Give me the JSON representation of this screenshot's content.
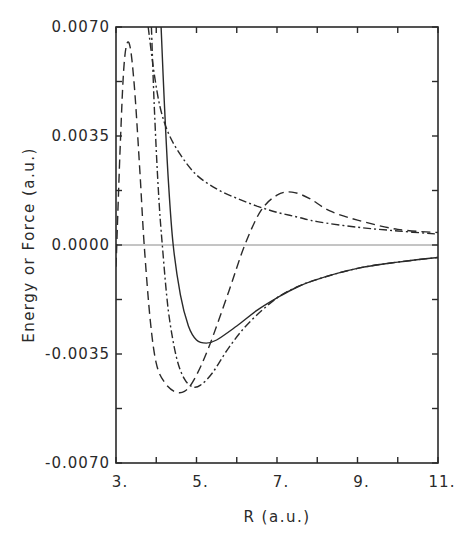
{
  "chart_data": {
    "type": "line",
    "title": "",
    "xlabel": "R (a.u.)",
    "ylabel": "Energy or Force (a.u.)",
    "xlim": [
      3,
      11
    ],
    "ylim": [
      -0.007,
      0.007
    ],
    "xticks": [
      3,
      5,
      7,
      9,
      11
    ],
    "xtick_labels": [
      "3.",
      "5.",
      "7.",
      "9.",
      "11."
    ],
    "xminor_ticks": [
      4,
      6,
      8,
      10
    ],
    "yticks": [
      -0.007,
      -0.0035,
      0.0,
      0.0035,
      0.007
    ],
    "ytick_labels": [
      "-0.0070",
      "-0.0035",
      "0.0000",
      "0.0035",
      "0.0070"
    ],
    "yminor_ticks": [
      -0.00525,
      -0.00175,
      0.00175,
      0.00525
    ],
    "grid": false,
    "legend": null,
    "reference_line": {
      "y": 0.0,
      "style": "thin gray"
    },
    "series": [
      {
        "name": "solid",
        "style": "solid",
        "x": [
          4.12,
          4.2,
          4.3,
          4.42,
          4.6,
          4.8,
          5.0,
          5.24,
          5.5,
          6.0,
          6.5,
          7.0,
          7.5,
          8.0,
          9.0,
          10.0,
          11.0
        ],
        "y": [
          0.007,
          0.0046,
          0.0021,
          0.0,
          -0.0016,
          -0.0026,
          -0.00305,
          -0.00315,
          -0.00305,
          -0.0026,
          -0.0021,
          -0.0017,
          -0.00135,
          -0.0011,
          -0.00075,
          -0.00055,
          -0.0004
        ]
      },
      {
        "name": "dash-dot (potential)",
        "style": "dashdot",
        "x": [
          3.88,
          3.95,
          4.05,
          4.15,
          4.3,
          4.5,
          4.7,
          4.9,
          5.1,
          5.4,
          5.8,
          6.3,
          7.0,
          7.5,
          8.0,
          9.0,
          10.0,
          11.0
        ],
        "y": [
          0.007,
          0.0045,
          0.0018,
          0.0,
          -0.0021,
          -0.0036,
          -0.0043,
          -0.00455,
          -0.0045,
          -0.0041,
          -0.0033,
          -0.0025,
          -0.0017,
          -0.00135,
          -0.0011,
          -0.00075,
          -0.00055,
          -0.0004
        ]
      },
      {
        "name": "dashed (force)",
        "style": "dashed",
        "x": [
          3.0,
          3.1,
          3.2,
          3.32,
          3.45,
          3.6,
          3.7,
          3.85,
          4.0,
          4.2,
          4.45,
          4.7,
          4.95,
          5.3,
          5.8,
          6.2,
          6.6,
          7.0,
          7.37,
          7.8,
          8.3,
          9.0,
          10.0,
          11.0
        ],
        "y": [
          -0.0007,
          0.003,
          0.0058,
          0.0065,
          0.0052,
          0.0022,
          0.0,
          -0.0024,
          -0.0038,
          -0.0044,
          -0.0047,
          -0.0047,
          -0.0043,
          -0.0033,
          -0.0015,
          0.0,
          0.0011,
          0.0016,
          0.0017,
          0.0015,
          0.0011,
          0.0008,
          0.0005,
          0.0004
        ]
      },
      {
        "name": "dash-dot (decaying)",
        "style": "dashdot",
        "x": [
          3.8,
          3.95,
          4.1,
          4.3,
          4.6,
          5.0,
          5.5,
          6.0,
          6.5,
          7.0,
          7.5,
          8.0,
          9.0,
          10.0,
          11.0
        ],
        "y": [
          0.007,
          0.0055,
          0.0044,
          0.0036,
          0.0029,
          0.00225,
          0.0018,
          0.0015,
          0.00125,
          0.00105,
          0.0009,
          0.00075,
          0.00057,
          0.00045,
          0.00035
        ]
      }
    ]
  }
}
